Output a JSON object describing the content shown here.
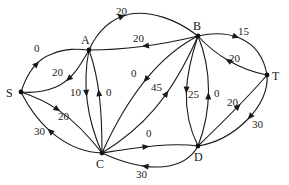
{
  "diagram": {
    "type": "flow-network",
    "nodes": [
      {
        "id": "S",
        "label": "S",
        "x": 21,
        "y": 92,
        "lx": 6,
        "ly": 97
      },
      {
        "id": "A",
        "label": "A",
        "x": 89,
        "y": 50,
        "lx": 81,
        "ly": 44
      },
      {
        "id": "B",
        "label": "B",
        "x": 198,
        "y": 36,
        "lx": 193,
        "ly": 30
      },
      {
        "id": "T",
        "label": "T",
        "x": 267,
        "y": 75,
        "lx": 272,
        "ly": 80
      },
      {
        "id": "C",
        "label": "C",
        "x": 102,
        "y": 153,
        "lx": 96,
        "ly": 168
      },
      {
        "id": "D",
        "label": "D",
        "x": 198,
        "y": 146,
        "lx": 194,
        "ly": 161
      }
    ],
    "edges": [
      {
        "from": "S",
        "to": "A",
        "label": "0",
        "path": "M21,92 C28,70 40,58 52,54 C66,48 78,49 89,50",
        "ax": 38,
        "ay": 66,
        "lx": 34,
        "ly": 52
      },
      {
        "from": "A",
        "to": "S",
        "label": "20",
        "path": "M89,50 C80,66 72,80 56,87 C44,92 32,93 21,92",
        "ax": 67,
        "ay": 76,
        "lx": 52,
        "ly": 76
      },
      {
        "from": "A",
        "to": "B",
        "label": "20",
        "path": "M89,50 C98,30 112,18 130,14 C150,11 175,18 198,36",
        "ax": 122,
        "ay": 18,
        "lx": 116,
        "ly": 15
      },
      {
        "from": "B",
        "to": "A",
        "label": "20",
        "path": "M198,36 C165,44 125,50 89,50",
        "ax": 146,
        "ay": 47,
        "lx": 133,
        "ly": 42
      },
      {
        "from": "A",
        "to": "C",
        "label": "10",
        "path": "M89,50 C84,75 83,110 102,153",
        "ax": 85,
        "ay": 93,
        "lx": 70,
        "ly": 96
      },
      {
        "from": "C",
        "to": "A",
        "label": "0",
        "path": "M102,153 C102,115 100,80 89,50",
        "ax": 102,
        "ay": 93,
        "lx": 106,
        "ly": 96
      },
      {
        "from": "S",
        "to": "C",
        "label": "20",
        "path": "M21,92 C45,100 70,112 102,153",
        "ax": 61,
        "ay": 103,
        "lx": 58,
        "ly": 120
      },
      {
        "from": "C",
        "to": "S",
        "label": "30",
        "path": "M102,153 C70,152 40,130 21,92",
        "ax": 50,
        "ay": 132,
        "lx": 34,
        "ly": 135
      },
      {
        "from": "B",
        "to": "C",
        "label": "0",
        "path": "M198,36 C170,50 135,80 102,153",
        "ax": 143,
        "ay": 76,
        "lx": 131,
        "ly": 77
      },
      {
        "from": "C",
        "to": "B",
        "label": "45",
        "path": "M102,153 C140,130 170,100 198,36",
        "ax": 162,
        "ay": 91,
        "lx": 151,
        "ly": 91
      },
      {
        "from": "C",
        "to": "D",
        "label": "0",
        "path": "M102,153 C135,148 170,142 198,146",
        "ax": 146,
        "ay": 147,
        "lx": 146,
        "ly": 137
      },
      {
        "from": "D",
        "to": "C",
        "label": "30",
        "path": "M198,146 C185,170 150,175 102,153",
        "ax": 146,
        "ay": 165,
        "lx": 136,
        "ly": 178
      },
      {
        "from": "B",
        "to": "D",
        "label": "25",
        "path": "M198,36 C185,75 180,110 198,146",
        "ax": 184,
        "ay": 89,
        "lx": 188,
        "ly": 98
      },
      {
        "from": "D",
        "to": "B",
        "label": "0",
        "path": "M198,146 C212,110 212,70 198,36",
        "ax": 210,
        "ay": 96,
        "lx": 214,
        "ly": 97
      },
      {
        "from": "B",
        "to": "T",
        "label": "15",
        "path": "M198,36 C225,30 260,35 267,75",
        "ax": 235,
        "ay": 38,
        "lx": 238,
        "ly": 35
      },
      {
        "from": "T",
        "to": "B",
        "label": "20",
        "path": "M267,75 C240,70 215,55 198,36",
        "ax": 229,
        "ay": 60,
        "lx": 229,
        "ly": 62
      },
      {
        "from": "D",
        "to": "T",
        "label": "20",
        "path": "M198,146 C225,120 250,95 267,75",
        "ax": 238,
        "ay": 107,
        "lx": 227,
        "ly": 106
      },
      {
        "from": "T",
        "to": "D",
        "label": "30",
        "path": "M267,75 C270,105 235,140 198,146",
        "ax": 255,
        "ay": 120,
        "lx": 252,
        "ly": 128
      }
    ]
  }
}
